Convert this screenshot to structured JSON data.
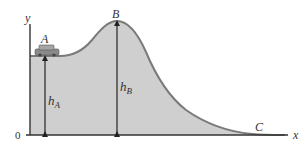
{
  "diagram": {
    "type": "roller-coaster-energy-profile",
    "axes": {
      "y_label": "y",
      "x_label": "x",
      "origin_label": "0"
    },
    "points": {
      "A": {
        "label": "A",
        "description": "car on flat section at height hA"
      },
      "B": {
        "label": "B",
        "description": "peak of hill at height hB"
      },
      "C": {
        "label": "C",
        "description": "bottom at ground level"
      }
    },
    "heights": {
      "hA": {
        "label": "h",
        "subscript": "A"
      },
      "hB": {
        "label": "h",
        "subscript": "B"
      }
    },
    "colors": {
      "fill": "#cfcfcf",
      "curve": "#7a7a7a",
      "axis": "#333333",
      "arrow": "#222222",
      "car": "#8a8a8a"
    }
  }
}
